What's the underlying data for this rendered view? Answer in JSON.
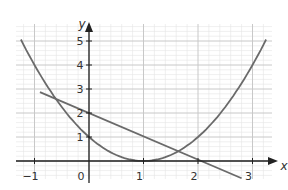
{
  "chart_data": {
    "type": "line",
    "title": "",
    "xlabel": "x",
    "ylabel": "y",
    "xlim": [
      -1.35,
      3.25
    ],
    "ylim": [
      -0.7,
      5.6
    ],
    "grid": true,
    "minor_grid_step": 0.2,
    "x_ticks": [
      -1,
      0,
      1,
      2,
      3
    ],
    "x_tick_labels": [
      "−1",
      "0",
      "1",
      "2",
      "3"
    ],
    "y_ticks": [
      1,
      2,
      3,
      4,
      5
    ],
    "y_tick_labels": [
      "1",
      "2",
      "3",
      "4",
      "5"
    ],
    "series": [
      {
        "name": "parabola",
        "equation": "y = (x - 1)^2",
        "x_range": [
          -1.25,
          3.25
        ],
        "points": [
          [
            -1.25,
            5.06
          ],
          [
            -1,
            4
          ],
          [
            -0.5,
            2.25
          ],
          [
            0,
            1
          ],
          [
            0.5,
            0.25
          ],
          [
            1,
            0
          ],
          [
            1.5,
            0.25
          ],
          [
            2,
            1
          ],
          [
            2.5,
            2.25
          ],
          [
            3,
            4
          ],
          [
            3.25,
            5.06
          ]
        ]
      },
      {
        "name": "straight line",
        "equation": "y = 2 - 0.97x",
        "x_range": [
          -0.9,
          2.8
        ],
        "points": [
          [
            -0.9,
            2.87
          ],
          [
            0,
            2
          ],
          [
            2.06,
            0
          ],
          [
            2.8,
            -0.72
          ]
        ]
      }
    ],
    "colors": {
      "curve": "#6a6a6a",
      "axis": "#222222",
      "grid_major": "#c8c8c8",
      "grid_minor": "#e4e4e4"
    }
  }
}
